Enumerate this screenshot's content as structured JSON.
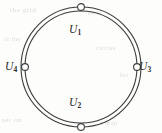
{
  "figure": {
    "type": "annulus-with-marked-points",
    "canvas": {
      "width": 162,
      "height": 133
    },
    "colors": {
      "stroke": "#3b3b3b",
      "node_fill": "#ffffff",
      "label": "#2b2b2b",
      "background": "#fdfdfc",
      "bleed_through": "#cfcdc8"
    },
    "outer_circle": {
      "cx": 81,
      "cy": 67,
      "r": 60,
      "stroke_width": 1.1
    },
    "inner_circle": {
      "cx": 81,
      "cy": 67,
      "r": 56,
      "stroke_width": 1.1
    },
    "nodes": [
      {
        "id": "node-top",
        "label": "U",
        "subscript": "1",
        "cx": 81,
        "cy": 7,
        "r": 3.4,
        "on": "outer"
      },
      {
        "id": "node-bottom",
        "label": "U",
        "subscript": "2",
        "cx": 81,
        "cy": 127,
        "r": 3.4,
        "on": "outer"
      },
      {
        "id": "node-right",
        "label": "U",
        "subscript": "3",
        "cx": 137,
        "cy": 67,
        "r": 3.4,
        "on": "inner"
      },
      {
        "id": "node-left",
        "label": "U",
        "subscript": "4",
        "cx": 25,
        "cy": 67,
        "r": 3.4,
        "on": "inner"
      }
    ],
    "labels": {
      "u1": {
        "text": "U",
        "sub": "1",
        "position": "inside-top"
      },
      "u2": {
        "text": "U",
        "sub": "2",
        "position": "inside-bottom"
      },
      "u3": {
        "text": "U",
        "sub": "3",
        "position": "outside-right"
      },
      "u4": {
        "text": "U",
        "sub": "4",
        "position": "outside-left"
      }
    }
  },
  "bleed_through": {
    "line_1": "the grid",
    "line_2": "in it",
    "line_3": "at the",
    "line_4": "circles",
    "line_5": "set on",
    "line_6": "a map",
    "line_7": "for"
  }
}
